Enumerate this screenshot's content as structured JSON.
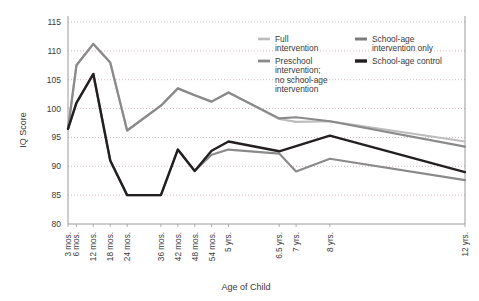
{
  "chart_data": {
    "type": "line",
    "title": "",
    "xlabel": "Age of Child",
    "ylabel": "IQ Score",
    "ylim": [
      80,
      115
    ],
    "ytick_values": [
      80,
      85,
      90,
      95,
      100,
      105,
      110,
      115
    ],
    "ytick_labels": [
      "80",
      "85",
      "90",
      "95",
      "100",
      "105",
      "110",
      "115"
    ],
    "grid": true,
    "grid_axis": "y",
    "legend_position": "top-right",
    "categories": [
      "3 mos.",
      "6 mos.",
      "12 mos.",
      "18 mos.",
      "24 mos.",
      "36 mos.",
      "42 mos.",
      "48 mos.",
      "54 mos.",
      "5 yrs.",
      "6.5 yrs.",
      "7 yrs.",
      "8 yrs.",
      "12 yrs."
    ],
    "x_months": [
      3,
      6,
      12,
      18,
      24,
      36,
      42,
      48,
      54,
      60,
      78,
      84,
      96,
      144
    ],
    "series": [
      {
        "name": "Full intervention",
        "color": "#bdbdbd",
        "width": 2.2,
        "values": [
          96.5,
          107.5,
          111.2,
          108.0,
          96.2,
          100.5,
          103.5,
          102.3,
          101.2,
          102.8,
          98.2,
          97.7,
          97.8,
          94.3
        ]
      },
      {
        "name": "Preschool intervention; no school-age intervention",
        "color": "#8a8a8a",
        "width": 2.2,
        "values": [
          96.5,
          107.5,
          111.2,
          108.0,
          96.2,
          100.5,
          103.5,
          102.3,
          101.2,
          102.8,
          98.3,
          98.5,
          97.8,
          93.4
        ]
      },
      {
        "name": "School-age intervention only",
        "color": "#8a8a8a",
        "width": 2.2,
        "values": [
          96.5,
          101.0,
          106.0,
          91.0,
          85.0,
          85.0,
          92.9,
          89.2,
          92.0,
          92.9,
          92.2,
          89.1,
          91.3,
          87.6
        ]
      },
      {
        "name": "School-age control",
        "color": "#231f20",
        "width": 2.4,
        "values": [
          96.5,
          101.0,
          106.0,
          91.0,
          85.0,
          85.0,
          92.9,
          89.2,
          92.7,
          94.3,
          92.6,
          93.5,
          95.3,
          89.0
        ]
      }
    ],
    "legend": [
      {
        "label_line1": "Full",
        "label_line2": "intervention",
        "label_line3": "",
        "label_line4": "",
        "color": "#bdbdbd",
        "width": 2.6
      },
      {
        "label_line1": "Preschool",
        "label_line2": "intervention;",
        "label_line3": "no school-age",
        "label_line4": "intervention",
        "color": "#8a8a8a",
        "width": 2.8
      },
      {
        "label_line1": "School-age",
        "label_line2": "intervention only",
        "label_line3": "",
        "label_line4": "",
        "color": "#7d7d7d",
        "width": 3.0
      },
      {
        "label_line1": "School-age control",
        "label_line2": "",
        "label_line3": "",
        "label_line4": "",
        "color": "#231f20",
        "width": 3.4
      }
    ],
    "colors": {
      "background": "#ffffff",
      "axis": "#9a9a9a",
      "grid": "#c9a9a9",
      "text": "#3a3a3a"
    }
  }
}
